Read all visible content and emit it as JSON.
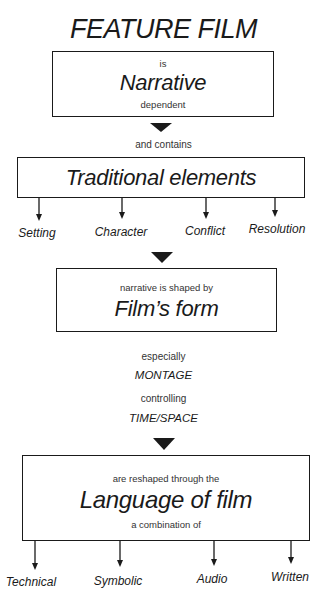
{
  "title": "FEATURE FILM",
  "box1": {
    "top": "is",
    "main": "Narrative",
    "bottom": "dependent"
  },
  "connector1": "and contains",
  "box2": {
    "main": "Traditional elements"
  },
  "elements": [
    "Setting",
    "Character",
    "Conflict",
    "Resolution"
  ],
  "box3": {
    "top": "narrative is shaped by",
    "main": "Film’s form"
  },
  "middle": {
    "line1": "especially",
    "line2": "MONTAGE",
    "line3": "controlling",
    "line4": "TIME/SPACE"
  },
  "box4": {
    "top": "are reshaped through the",
    "main": "Language of film",
    "bottom": "a combination of"
  },
  "languages": [
    "Technical",
    "Symbolic",
    "Audio",
    "Written"
  ],
  "colors": {
    "ink": "#1a1a1a",
    "background": "#ffffff"
  }
}
